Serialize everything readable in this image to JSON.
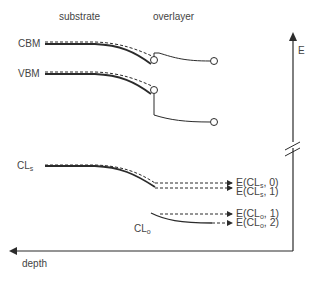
{
  "diagram": {
    "type": "band-diagram",
    "regions": {
      "substrate_label": "substrate",
      "overlayer_label": "overlayer"
    },
    "levels": {
      "cbm_label": "CBM",
      "vbm_label": "VBM",
      "cl_s_label": "CL",
      "cl_s_sub": "s",
      "cl_o_label": "CL",
      "cl_o_sub": "o"
    },
    "axes": {
      "energy_label": "E",
      "depth_label": "depth"
    },
    "energy_labels": [
      {
        "prefix": "E(CL",
        "sub": "s",
        "suffix": ", 0)"
      },
      {
        "prefix": "E(CL",
        "sub": "s",
        "suffix": ", 1)"
      },
      {
        "prefix": "E(CL",
        "sub": "o",
        "suffix": ", 1)"
      },
      {
        "prefix": "E(CL",
        "sub": "o",
        "suffix": ", 2)"
      }
    ],
    "colors": {
      "line": "#2b2b2b",
      "text": "#444444",
      "background": "#ffffff"
    }
  }
}
